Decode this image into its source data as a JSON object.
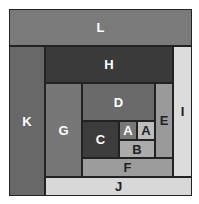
{
  "diagram": {
    "type": "treemap-spiral",
    "cells": [
      {
        "label": "L",
        "x": 9,
        "y": 9,
        "w": 183,
        "h": 37,
        "color": "#7a7a7a",
        "text": "dark"
      },
      {
        "label": "K",
        "x": 9,
        "y": 46,
        "w": 36,
        "h": 150,
        "color": "#686868",
        "text": "dark"
      },
      {
        "label": "H",
        "x": 45,
        "y": 46,
        "w": 128,
        "h": 37,
        "color": "#3a3a3a",
        "text": "dark"
      },
      {
        "label": "I",
        "x": 173,
        "y": 46,
        "w": 19,
        "h": 131,
        "color": "#dcdcdc",
        "text": "light"
      },
      {
        "label": "J",
        "x": 45,
        "y": 177,
        "w": 147,
        "h": 19,
        "color": "#d8d8d8",
        "text": "light"
      },
      {
        "label": "G",
        "x": 45,
        "y": 83,
        "w": 37,
        "h": 94,
        "color": "#777777",
        "text": "dark"
      },
      {
        "label": "D",
        "x": 82,
        "y": 83,
        "w": 73,
        "h": 38,
        "color": "#6a6a6a",
        "text": "dark"
      },
      {
        "label": "E",
        "x": 155,
        "y": 83,
        "w": 18,
        "h": 75,
        "color": "#9a9a9a",
        "text": "light"
      },
      {
        "label": "F",
        "x": 82,
        "y": 158,
        "w": 91,
        "h": 19,
        "color": "#9c9c9c",
        "text": "light"
      },
      {
        "label": "C",
        "x": 82,
        "y": 121,
        "w": 37,
        "h": 37,
        "color": "#3c3c3c",
        "text": "dark"
      },
      {
        "label": "A",
        "x": 119,
        "y": 121,
        "w": 18,
        "h": 19,
        "color": "#777777",
        "text": "dark"
      },
      {
        "label": "A",
        "x": 137,
        "y": 121,
        "w": 18,
        "h": 19,
        "color": "#bdbdbd",
        "text": "light"
      },
      {
        "label": "B",
        "x": 119,
        "y": 140,
        "w": 36,
        "h": 18,
        "color": "#ababab",
        "text": "light"
      }
    ]
  }
}
